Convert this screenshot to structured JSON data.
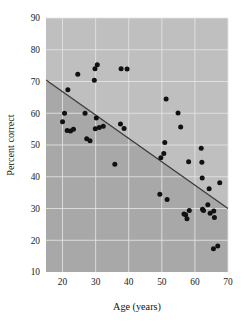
{
  "chart_data": {
    "type": "scatter",
    "title": "",
    "xlabel": "Age (years)",
    "ylabel": "Percent correct",
    "xlim": [
      15,
      70
    ],
    "ylim": [
      10,
      90
    ],
    "xticks": [
      20,
      30,
      40,
      50,
      60,
      70
    ],
    "yticks": [
      10,
      20,
      30,
      40,
      50,
      60,
      70,
      80,
      90
    ],
    "grid": true,
    "legend": "none",
    "plot_bg_color": "#bfbfbf",
    "shaded_region_color": "#a8a8a8",
    "point_color": "#111111",
    "line_color": "#3a3a3a",
    "trendline": {
      "label": "regression line",
      "x_start": 15,
      "y_start": 70.5,
      "x_end": 70,
      "y_end": 30.0
    },
    "points": [
      {
        "x": 20.0,
        "y": 57.3
      },
      {
        "x": 20.6,
        "y": 60.0
      },
      {
        "x": 21.6,
        "y": 67.4
      },
      {
        "x": 21.4,
        "y": 54.6
      },
      {
        "x": 22.4,
        "y": 54.4
      },
      {
        "x": 23.3,
        "y": 55.0
      },
      {
        "x": 24.6,
        "y": 72.3
      },
      {
        "x": 26.8,
        "y": 60.0
      },
      {
        "x": 27.3,
        "y": 52.0
      },
      {
        "x": 28.3,
        "y": 51.3
      },
      {
        "x": 29.6,
        "y": 70.4
      },
      {
        "x": 29.8,
        "y": 74.0
      },
      {
        "x": 30.5,
        "y": 75.3
      },
      {
        "x": 30.2,
        "y": 58.5
      },
      {
        "x": 29.9,
        "y": 55.1
      },
      {
        "x": 31.1,
        "y": 55.5
      },
      {
        "x": 32.3,
        "y": 55.9
      },
      {
        "x": 35.8,
        "y": 43.9
      },
      {
        "x": 37.7,
        "y": 74.0
      },
      {
        "x": 37.5,
        "y": 56.6
      },
      {
        "x": 38.6,
        "y": 55.2
      },
      {
        "x": 39.5,
        "y": 73.9
      },
      {
        "x": 49.4,
        "y": 34.5
      },
      {
        "x": 49.7,
        "y": 46.0
      },
      {
        "x": 50.6,
        "y": 47.3
      },
      {
        "x": 50.9,
        "y": 50.8
      },
      {
        "x": 51.3,
        "y": 64.5
      },
      {
        "x": 51.6,
        "y": 32.8
      },
      {
        "x": 54.9,
        "y": 60.1
      },
      {
        "x": 55.7,
        "y": 55.7
      },
      {
        "x": 56.7,
        "y": 28.3
      },
      {
        "x": 57.2,
        "y": 28.0
      },
      {
        "x": 57.6,
        "y": 26.8
      },
      {
        "x": 58.3,
        "y": 29.4
      },
      {
        "x": 58.1,
        "y": 44.7
      },
      {
        "x": 61.9,
        "y": 49.0
      },
      {
        "x": 62.1,
        "y": 44.6
      },
      {
        "x": 62.3,
        "y": 29.8
      },
      {
        "x": 62.6,
        "y": 29.4
      },
      {
        "x": 62.2,
        "y": 39.6
      },
      {
        "x": 63.9,
        "y": 31.2
      },
      {
        "x": 64.6,
        "y": 28.5
      },
      {
        "x": 64.3,
        "y": 36.2
      },
      {
        "x": 65.7,
        "y": 29.2
      },
      {
        "x": 65.9,
        "y": 27.2
      },
      {
        "x": 65.6,
        "y": 17.3
      },
      {
        "x": 66.9,
        "y": 18.2
      },
      {
        "x": 67.5,
        "y": 38.1
      }
    ]
  },
  "axes": {
    "x_tick_labels": [
      "20",
      "30",
      "40",
      "50",
      "60",
      "70"
    ],
    "y_tick_labels": [
      "10",
      "20",
      "30",
      "40",
      "50",
      "60",
      "70",
      "80",
      "90"
    ],
    "x_axis_title": "Age (years)",
    "y_axis_title": "Percent correct"
  }
}
